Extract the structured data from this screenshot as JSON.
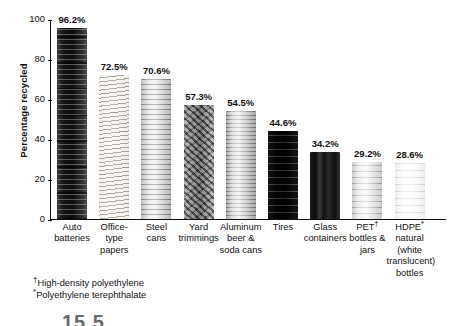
{
  "chart_data": {
    "type": "bar",
    "title": "",
    "xlabel": "",
    "ylabel": "Percentage recycled",
    "ylim": [
      0,
      100
    ],
    "yticks": [
      0,
      20,
      40,
      60,
      80,
      100
    ],
    "grid": false,
    "legend": "none",
    "categories": [
      "Auto batteries",
      "Office-type papers",
      "Steel cans",
      "Yard trimmings",
      "Aluminum beer & soda cans",
      "Tires",
      "Glass containers",
      "PET† bottles & jars",
      "HDPE* natural (white translucent) bottles"
    ],
    "values": [
      96.2,
      72.5,
      70.6,
      57.3,
      54.5,
      44.6,
      34.2,
      29.2,
      28.6
    ],
    "data_labels": [
      "96.2%",
      "72.5%",
      "70.6%",
      "57.3%",
      "54.5%",
      "44.6%",
      "34.2%",
      "29.2%",
      "28.6%"
    ],
    "bars": [
      {
        "label_lines": [
          "Auto",
          "batteries"
        ],
        "value": 96.2,
        "data_label": "96.2%",
        "texture": "tex-batteries",
        "image_subject": "stacked car batteries"
      },
      {
        "label_lines": [
          "Office-",
          "type",
          "papers"
        ],
        "value": 72.5,
        "data_label": "72.5%",
        "texture": "tex-papers",
        "image_subject": "stack of office paper"
      },
      {
        "label_lines": [
          "Steel",
          "cans"
        ],
        "value": 70.6,
        "data_label": "70.6%",
        "texture": "tex-steel",
        "image_subject": "steel food can"
      },
      {
        "label_lines": [
          "Yard",
          "trimmings"
        ],
        "value": 57.3,
        "data_label": "57.3%",
        "texture": "tex-yard",
        "image_subject": "yard trimmings bundle"
      },
      {
        "label_lines": [
          "Aluminum",
          "beer &",
          "soda cans"
        ],
        "value": 54.5,
        "data_label": "54.5%",
        "texture": "tex-aluminum",
        "image_subject": "aluminum beverage cans"
      },
      {
        "label_lines": [
          "Tires"
        ],
        "value": 44.6,
        "data_label": "44.6%",
        "texture": "tex-tires",
        "image_subject": "stacked tires"
      },
      {
        "label_lines": [
          "Glass",
          "containers"
        ],
        "value": 34.2,
        "data_label": "34.2%",
        "texture": "tex-glass",
        "image_subject": "dark glass bottles"
      },
      {
        "label_lines": [
          "PET†",
          "bottles &",
          "jars"
        ],
        "value": 29.2,
        "data_label": "29.2%",
        "texture": "tex-pet",
        "image_subject": "clear PET soda bottle"
      },
      {
        "label_lines": [
          "HDPE*",
          "natural",
          "(white",
          "translucent)",
          "bottles"
        ],
        "value": 28.6,
        "data_label": "28.6%",
        "texture": "tex-hdpe",
        "image_subject": "white HDPE milk jug"
      }
    ]
  },
  "axis": {
    "y_title": "Percentage recycled",
    "y_tick_labels": [
      "100",
      "80",
      "60",
      "40",
      "20",
      "0"
    ]
  },
  "footnotes": [
    {
      "symbol": "†",
      "text": "High-density polyethylene"
    },
    {
      "symbol": "*",
      "text": "Polyethylene terephthalate"
    }
  ],
  "caption_partial": "15.5"
}
